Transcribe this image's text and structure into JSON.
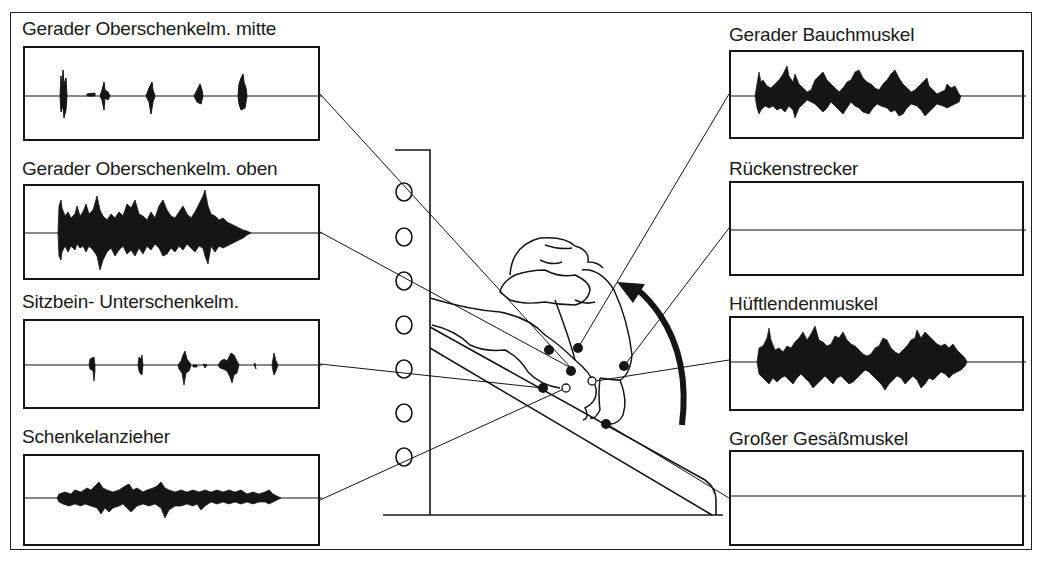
{
  "figure": {
    "arrow_direction": "counter-clockwise upward (trunk flexion)"
  },
  "panels": {
    "left": [
      {
        "label": "Gerader Oberschenkelm. mitte",
        "activity": "bursts",
        "bursts": 5
      },
      {
        "label": "Gerader Oberschenkelm. oben",
        "activity": "continuous-high"
      },
      {
        "label": "Sitzbein- Unterschenkelm.",
        "activity": "sparse-bursts"
      },
      {
        "label": "Schenkelanzieher",
        "activity": "continuous-low"
      }
    ],
    "right": [
      {
        "label": "Gerader Bauchmuskel",
        "activity": "continuous-high"
      },
      {
        "label": "Rückenstrecker",
        "activity": "none"
      },
      {
        "label": "Hüftlendenmuskel",
        "activity": "continuous-high"
      },
      {
        "label": "Großer Gesäßmuskel",
        "activity": "none"
      }
    ]
  },
  "colors": {
    "ink": "#151515",
    "background": "#ffffff"
  }
}
